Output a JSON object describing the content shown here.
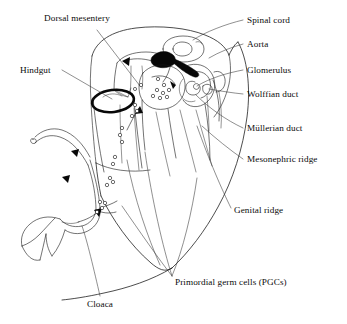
{
  "figure": {
    "background_color": "#ffffff",
    "ink_color": "#111111",
    "width": 347,
    "height": 324
  },
  "labels": [
    {
      "id": "dorsal-mesentery",
      "text": "Dorsal mesentery",
      "x": 44,
      "y": 14,
      "align": "left"
    },
    {
      "id": "spinal-cord",
      "text": "Spinal cord",
      "x": 247,
      "y": 16,
      "align": "left"
    },
    {
      "id": "aorta",
      "text": "Aorta",
      "x": 247,
      "y": 40,
      "align": "left"
    },
    {
      "id": "hindgut",
      "text": "Hindgut",
      "x": 20,
      "y": 66,
      "align": "left"
    },
    {
      "id": "glomerulus",
      "text": "Glomerulus",
      "x": 247,
      "y": 66,
      "align": "left"
    },
    {
      "id": "wolffian-duct",
      "text": "Wolffian duct",
      "x": 247,
      "y": 90,
      "align": "left"
    },
    {
      "id": "mullerian-duct",
      "text": "Müllerian duct",
      "x": 247,
      "y": 124,
      "align": "left"
    },
    {
      "id": "mesonephric-ridge",
      "text": "Mesonephric ridge",
      "x": 247,
      "y": 155,
      "align": "left"
    },
    {
      "id": "genital-ridge",
      "text": "Genital ridge",
      "x": 234,
      "y": 206,
      "align": "left"
    },
    {
      "id": "primordial-germ-cells",
      "text": "Primordial germ cells (PGCs)",
      "x": 175,
      "y": 278,
      "align": "left"
    },
    {
      "id": "cloaca",
      "text": "Cloaca",
      "x": 87,
      "y": 300,
      "align": "left"
    }
  ],
  "structures": [
    {
      "id": "body-outline",
      "name": "embryo body wall outline"
    },
    {
      "id": "spinal-cord-shape",
      "name": "spinal cord cross-section"
    },
    {
      "id": "aorta-shape",
      "name": "dorsal aorta (filled black)"
    },
    {
      "id": "hindgut-shape",
      "name": "hindgut lumen (thick ring)"
    },
    {
      "id": "genital-ridge-shape",
      "name": "genital ridge"
    },
    {
      "id": "mesonephric-ridge-shape",
      "name": "mesonephric ridge"
    },
    {
      "id": "glomerulus-shape",
      "name": "glomerulus coil"
    },
    {
      "id": "wolffian-duct-shape",
      "name": "Wolffian duct"
    },
    {
      "id": "mullerian-duct-shape",
      "name": "Müllerian duct"
    },
    {
      "id": "cloaca-shape",
      "name": "cloaca and tail gut"
    },
    {
      "id": "dorsal-mesentery-shape",
      "name": "dorsal mesentery"
    },
    {
      "id": "pgc-cells",
      "name": "primordial germ cells"
    },
    {
      "id": "migration-arrows",
      "name": "PGC migration direction arrows"
    }
  ],
  "counts": {
    "migration_arrows": 5,
    "pgc_clusters": 8
  }
}
